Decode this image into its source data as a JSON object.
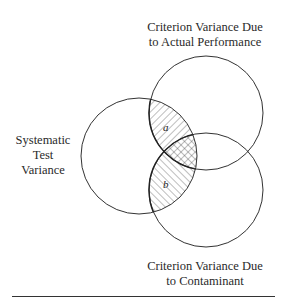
{
  "diagram": {
    "type": "venn",
    "circles": [
      {
        "id": "actual-performance",
        "label_lines": [
          "Criterion Variance Due",
          "to Actual Performance"
        ],
        "cx": 206,
        "cy": 113,
        "r": 57
      },
      {
        "id": "systematic-test",
        "label_lines": [
          "Systematic",
          "Test",
          "Variance"
        ],
        "cx": 139,
        "cy": 156,
        "r": 58
      },
      {
        "id": "contaminant",
        "label_lines": [
          "Criterion Variance Due",
          "to Contaminant"
        ],
        "cx": 206,
        "cy": 190,
        "r": 57
      }
    ],
    "regions": [
      {
        "id": "a",
        "letter": "a",
        "hatch": "diagonal-down",
        "description": "Systematic test variance overlapping actual performance only"
      },
      {
        "id": "b",
        "letter": "b",
        "hatch": "diagonal-up",
        "description": "Systematic test variance overlapping contaminant only"
      },
      {
        "id": "ab",
        "letter": "",
        "hatch": "cross",
        "description": "Triple overlap"
      }
    ],
    "colors": {
      "stroke": "#333333",
      "hatch": "#444444",
      "background": "#ffffff"
    }
  },
  "labels": {
    "top": {
      "line1": "Criterion Variance Due",
      "line2": "to Actual Performance"
    },
    "left": {
      "line1": "Systematic",
      "line2": "Test",
      "line3": "Variance"
    },
    "bottom": {
      "line1": "Criterion Variance Due",
      "line2": "to Contaminant"
    },
    "region_a": "a",
    "region_b": "b"
  }
}
